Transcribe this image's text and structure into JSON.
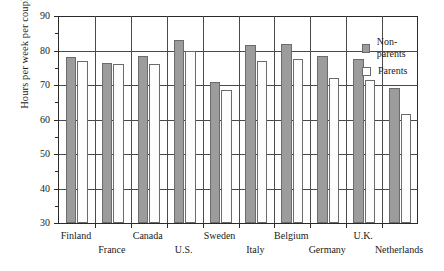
{
  "chart_data": {
    "type": "bar",
    "title": "",
    "xlabel": "",
    "ylabel": "Hours per week per couple",
    "ylim": [
      30,
      90
    ],
    "ytick_step": 10,
    "yminor_step": 5,
    "grid": true,
    "legend_position": "top-right",
    "yticks": [
      "90",
      "80",
      "70",
      "60",
      "50",
      "40",
      "30"
    ],
    "categories": [
      "Finland",
      "France",
      "Canada",
      "U.S.",
      "Sweden",
      "Italy",
      "Belgium",
      "Germany",
      "U.K.",
      "Netherlands"
    ],
    "series": [
      {
        "name": "Non-parents",
        "color": "#9c9c9c",
        "values": [
          78,
          76.5,
          78.5,
          83,
          71,
          81.5,
          82,
          78.5,
          77.5,
          69
        ]
      },
      {
        "name": "Parents",
        "color": "#ffffff",
        "values": [
          77,
          76,
          76,
          80,
          68.5,
          77,
          77.5,
          72,
          71.5,
          61.5
        ]
      }
    ]
  },
  "legend": {
    "entries": [
      {
        "label": "Non-parents",
        "swatch": "non-parents-swatch"
      },
      {
        "label": "Parents",
        "swatch": "parents-swatch"
      }
    ]
  }
}
